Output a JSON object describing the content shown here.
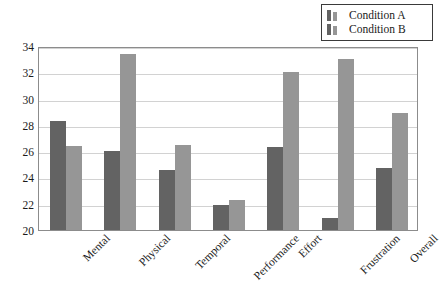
{
  "chart_data": {
    "type": "bar",
    "title": "",
    "xlabel": "",
    "ylabel": "",
    "categories": [
      "Mental",
      "Physical",
      "Temporal",
      "Performance",
      "Effort",
      "Frustration",
      "Overall"
    ],
    "series": [
      {
        "name": "Condition A",
        "color": "#636363",
        "values": [
          28.3,
          26.0,
          24.6,
          21.9,
          26.3,
          20.9,
          24.7
        ]
      },
      {
        "name": "Condition B",
        "color": "#969696",
        "values": [
          26.4,
          33.4,
          26.5,
          22.3,
          32.0,
          33.0,
          28.9
        ]
      }
    ],
    "ylim": [
      20,
      34
    ],
    "yticks": [
      20,
      22,
      24,
      26,
      28,
      30,
      32,
      34
    ],
    "ytick_labels": [
      "20",
      "22",
      "24",
      "26",
      "28",
      "30",
      "32",
      "34"
    ],
    "grid": true,
    "grid_axis": "y",
    "legend_position": "top-right",
    "legend": {
      "entries": [
        {
          "label": "Condition A",
          "swatch_dark": "#636363",
          "swatch_light": "#969696"
        },
        {
          "label": "Condition B",
          "swatch_dark": "#636363",
          "swatch_light": "#969696"
        }
      ]
    },
    "xtick_rotation": -45,
    "frame_color": "#8c8c8c",
    "gridline_color": "#d2d2d2",
    "background": "#ffffff"
  }
}
